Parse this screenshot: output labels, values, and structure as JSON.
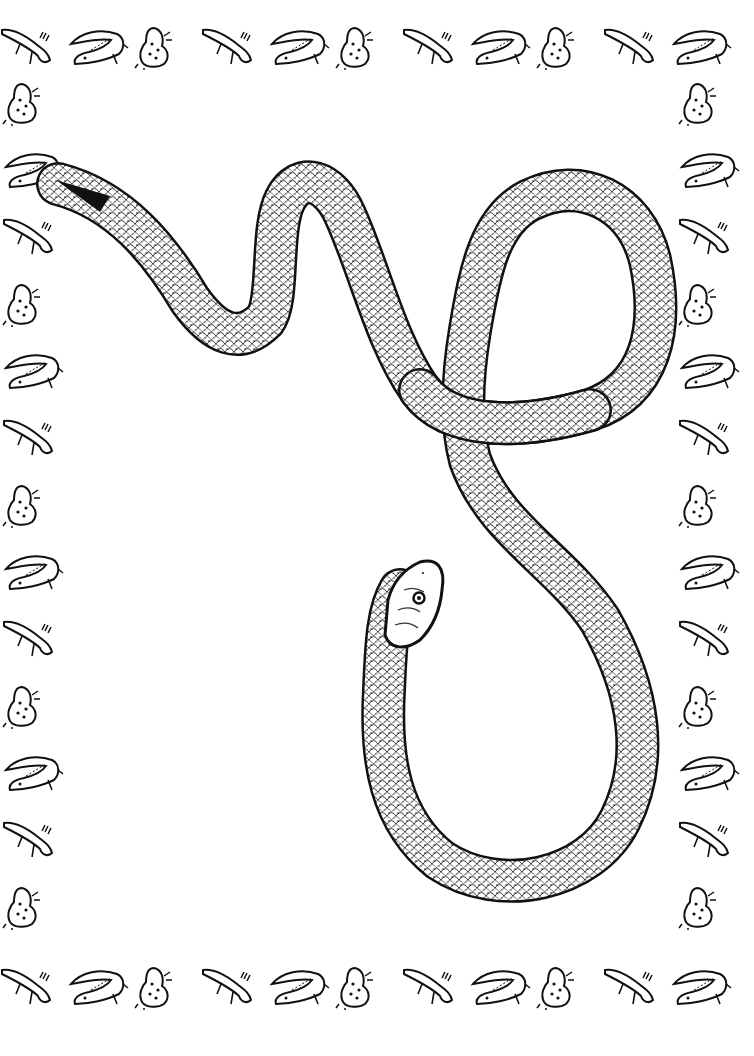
{
  "page": {
    "type": "coloring-page",
    "background_color": "#ffffff",
    "line_color": "#111111"
  },
  "border": {
    "pattern": [
      "newt",
      "alligator",
      "frog"
    ],
    "top_row": [
      "newt",
      "alligator",
      "frog",
      "newt",
      "alligator",
      "frog",
      "newt",
      "alligator",
      "frog",
      "newt",
      "alligator"
    ],
    "bottom_row": [
      "newt",
      "alligator",
      "frog",
      "newt",
      "alligator",
      "frog",
      "newt",
      "alligator",
      "frog",
      "newt",
      "alligator"
    ],
    "left_column": [
      "frog",
      "alligator",
      "newt",
      "frog",
      "alligator",
      "newt",
      "frog",
      "alligator",
      "newt",
      "frog",
      "alligator",
      "newt",
      "frog"
    ],
    "right_column": [
      "frog",
      "alligator",
      "newt",
      "frog",
      "alligator",
      "newt",
      "frog",
      "alligator",
      "newt",
      "frog",
      "alligator",
      "newt",
      "frog"
    ]
  },
  "illustration": {
    "name": "snake",
    "parts": [
      "tail",
      "body-loop",
      "head"
    ],
    "texture": "scales"
  }
}
